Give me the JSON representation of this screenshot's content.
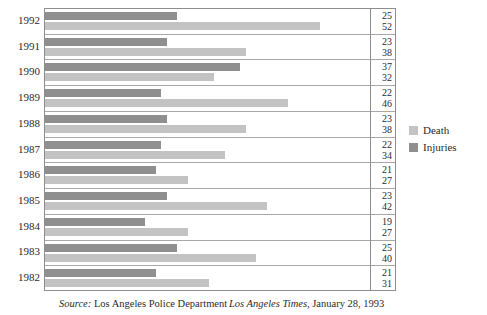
{
  "chart_data": {
    "type": "bar",
    "orientation": "horizontal",
    "title": "",
    "subtitle": "",
    "xlabel": "",
    "ylabel": "",
    "grid": false,
    "legend_position": "right",
    "axis_visible": false,
    "categories": [
      "1992",
      "1991",
      "1990",
      "1989",
      "1988",
      "1987",
      "1986",
      "1985",
      "1984",
      "1983",
      "1982"
    ],
    "series": [
      {
        "name": "Injuries",
        "color": "#8f8f8f",
        "values": [
          25,
          23,
          37,
          22,
          23,
          22,
          21,
          23,
          19,
          25,
          21
        ]
      },
      {
        "name": "Death",
        "color": "#c3c3c3",
        "values": [
          52,
          38,
          32,
          46,
          38,
          34,
          27,
          42,
          27,
          40,
          31
        ]
      }
    ],
    "value_labels": [
      {
        "category": "1992",
        "injuries": 25,
        "death": 52
      },
      {
        "category": "1991",
        "injuries": 23,
        "death": 38
      },
      {
        "category": "1990",
        "injuries": 37,
        "death": 32
      },
      {
        "category": "1989",
        "injuries": 22,
        "death": 46
      },
      {
        "category": "1988",
        "injuries": 23,
        "death": 38
      },
      {
        "category": "1987",
        "injuries": 22,
        "death": 34
      },
      {
        "category": "1986",
        "injuries": 21,
        "death": 27
      },
      {
        "category": "1985",
        "injuries": 23,
        "death": 42
      },
      {
        "category": "1984",
        "injuries": 19,
        "death": 27
      },
      {
        "category": "1983",
        "injuries": 25,
        "death": 40
      },
      {
        "category": "1982",
        "injuries": 21,
        "death": 31
      }
    ],
    "xlim": [
      0,
      60
    ]
  },
  "legend": {
    "items": [
      {
        "label": "Death",
        "color": "#c3c3c3"
      },
      {
        "label": "Injuries",
        "color": "#8f8f8f"
      }
    ]
  },
  "footer": {
    "source_label": "Source:",
    "source_value": "Los Angeles Police Department",
    "credit_publication": "Los Angeles Times",
    "credit_date": ", January 28, 1993"
  }
}
